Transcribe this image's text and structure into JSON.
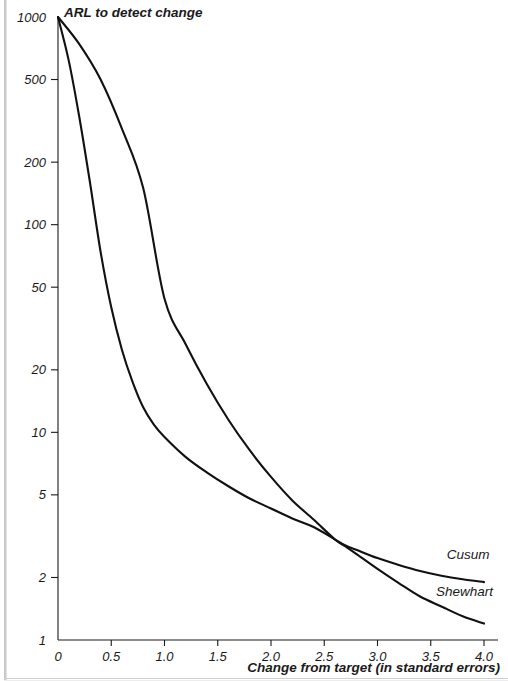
{
  "chart_data": {
    "type": "line",
    "title": "ARL to detect change",
    "xlabel": "Change from target (in standard errors)",
    "ylabel": "ARL to detect change",
    "xlim": [
      0,
      4.0
    ],
    "ylim": [
      1,
      1000
    ],
    "yscale": "log",
    "xscale": "linear",
    "grid": false,
    "legend_position": "inline-right-of-curve-ends",
    "xticks": [
      0,
      0.5,
      1.0,
      1.5,
      2.0,
      2.5,
      3.0,
      3.5,
      4.0
    ],
    "xticklabels": [
      "0",
      "0.5",
      "1.0",
      "1.5",
      "2.0",
      "2.5",
      "3.0",
      "3.5",
      "4.0"
    ],
    "yticks": [
      1,
      2,
      5,
      10,
      20,
      50,
      100,
      200,
      500,
      1000
    ],
    "yticklabels": [
      "1",
      "2",
      "5",
      "10",
      "20",
      "50",
      "100",
      "200",
      "500",
      "1000"
    ],
    "series": [
      {
        "name": "Cusum",
        "label": "Cusum",
        "x": [
          0,
          0.1,
          0.2,
          0.3,
          0.4,
          0.5,
          0.6,
          0.7,
          0.8,
          0.9,
          1.0,
          1.2,
          1.4,
          1.6,
          1.8,
          2.0,
          2.2,
          2.4,
          2.6,
          2.7,
          2.8,
          3.0,
          3.2,
          3.4,
          3.6,
          3.8,
          4.0
        ],
        "y": [
          1000,
          620,
          330,
          160,
          74,
          40,
          25,
          17.5,
          13.2,
          10.9,
          9.5,
          7.6,
          6.4,
          5.5,
          4.8,
          4.3,
          3.85,
          3.5,
          3.05,
          2.85,
          2.72,
          2.48,
          2.3,
          2.15,
          2.04,
          1.96,
          1.9
        ]
      },
      {
        "name": "Shewhart",
        "label": "Shewhart",
        "x": [
          0,
          0.2,
          0.4,
          0.6,
          0.8,
          1.0,
          1.2,
          1.4,
          1.6,
          1.8,
          2.0,
          2.2,
          2.4,
          2.6,
          2.7,
          2.8,
          3.0,
          3.2,
          3.4,
          3.6,
          3.8,
          4.0
        ],
        "y": [
          1000,
          740,
          500,
          290,
          150,
          44,
          26.5,
          17.0,
          11.5,
          8.2,
          6.1,
          4.7,
          3.8,
          3.05,
          2.82,
          2.6,
          2.2,
          1.88,
          1.62,
          1.45,
          1.3,
          1.2
        ]
      }
    ],
    "annotations": [
      {
        "text": "Cusum",
        "x": 3.65,
        "y": 2.45
      },
      {
        "text": "Shewhart",
        "x": 3.55,
        "y": 1.62
      }
    ]
  },
  "axes": {
    "title_text": "ARL to detect change",
    "x_axis_title": "Change from target (in standard errors)"
  },
  "colors": {
    "curve": "#111111",
    "axis": "#1a1a1a",
    "text": "#1a1a1a",
    "background": "#ffffff",
    "page_edge": "#c9c9c9"
  }
}
